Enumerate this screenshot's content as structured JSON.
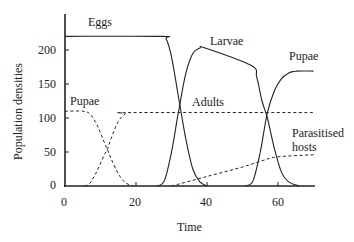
{
  "chart_data": {
    "type": "line",
    "title": "",
    "xlabel": "Time",
    "ylabel": "Population densities",
    "xlim": [
      0,
      70
    ],
    "ylim": [
      0,
      235
    ],
    "x_ticks": [
      0,
      20,
      40,
      60
    ],
    "y_ticks": [
      0,
      50,
      100,
      150,
      200
    ],
    "grid": false,
    "legend": "inline labels",
    "series": [
      {
        "name": "Eggs",
        "style": "solid",
        "points": [
          [
            0,
            220
          ],
          [
            27,
            220
          ],
          [
            28.5,
            216
          ],
          [
            30,
            190
          ],
          [
            32,
            130
          ],
          [
            34,
            70
          ],
          [
            36,
            25
          ],
          [
            38,
            6
          ],
          [
            40,
            0
          ]
        ]
      },
      {
        "name": "Larvae",
        "style": "solid",
        "points": [
          [
            26,
            0
          ],
          [
            28,
            8
          ],
          [
            30,
            50
          ],
          [
            32,
            110
          ],
          [
            34,
            165
          ],
          [
            36,
            195
          ],
          [
            38,
            203
          ],
          [
            39.5,
            203
          ],
          [
            52.5,
            177
          ],
          [
            54,
            160
          ],
          [
            55.5,
            125
          ],
          [
            57,
            100
          ],
          [
            59,
            55
          ],
          [
            61,
            20
          ],
          [
            63,
            6
          ],
          [
            66,
            0
          ]
        ]
      },
      {
        "name": "Pupae (solid, second generation)",
        "label": "Pupae",
        "style": "solid",
        "points": [
          [
            51,
            0
          ],
          [
            53,
            8
          ],
          [
            55,
            50
          ],
          [
            57,
            108
          ],
          [
            59,
            140
          ],
          [
            61,
            158
          ],
          [
            63,
            166
          ],
          [
            65,
            169
          ],
          [
            70,
            169
          ]
        ]
      },
      {
        "name": "Pupae (dashed)",
        "label": "Pupae",
        "style": "dashed",
        "points": [
          [
            0,
            110
          ],
          [
            5,
            110
          ],
          [
            7,
            106
          ],
          [
            9,
            90
          ],
          [
            11,
            65
          ],
          [
            12,
            53
          ],
          [
            13,
            40
          ],
          [
            15,
            18
          ],
          [
            17,
            5
          ],
          [
            19,
            0
          ]
        ]
      },
      {
        "name": "Adults",
        "style": "dashed",
        "points": [
          [
            5.5,
            0
          ],
          [
            7,
            4
          ],
          [
            9,
            22
          ],
          [
            11,
            45
          ],
          [
            12,
            55
          ],
          [
            13,
            70
          ],
          [
            15,
            95
          ],
          [
            17,
            106
          ],
          [
            19,
            108
          ],
          [
            70,
            108
          ]
        ]
      },
      {
        "name": "Parasitised hosts",
        "style": "dashed",
        "points": [
          [
            30,
            0
          ],
          [
            40,
            14
          ],
          [
            50,
            28
          ],
          [
            56,
            38
          ],
          [
            60,
            43
          ],
          [
            70,
            46
          ]
        ]
      }
    ],
    "annotations": [
      {
        "text": "Eggs",
        "x": 8,
        "y": 232
      },
      {
        "text": "Larvae",
        "x": 46,
        "y": 208
      },
      {
        "text": "Pupae",
        "x": 66,
        "y": 185
      },
      {
        "text": "Pupae",
        "x": 1,
        "y": 120
      },
      {
        "text": "Adults",
        "x": 35,
        "y": 115
      },
      {
        "text": "Parasitised hosts",
        "x": 62,
        "y": 65
      }
    ]
  },
  "labels": {
    "eggs": "Eggs",
    "larvae": "Larvae",
    "pupae_right": "Pupae",
    "pupae_left": "Pupae",
    "adults": "Adults",
    "parasitised_line1": "Parasitised",
    "parasitised_line2": "hosts",
    "xlabel": "Time",
    "ylabel": "Population densities",
    "xticks": [
      "0",
      "20",
      "40",
      "60"
    ],
    "yticks": [
      "0",
      "50",
      "100",
      "150",
      "200"
    ]
  }
}
